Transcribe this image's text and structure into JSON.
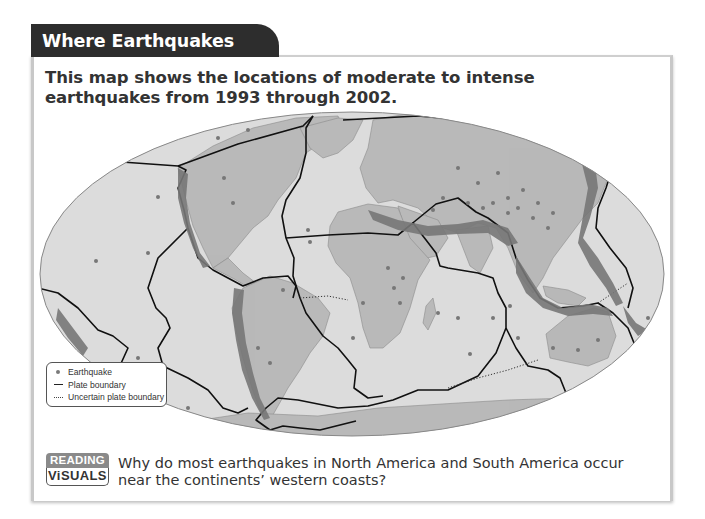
{
  "header": {
    "title": "Where Earthquakes Occur"
  },
  "intro": {
    "text": "This map shows the locations of moderate to intense earthquakes from 1993 through 2002."
  },
  "map": {
    "projection": "elliptical world map",
    "colors": {
      "ocean": "#dcdcdc",
      "land": "#b9b9b9",
      "earthquake": "#777777",
      "plate_boundary": "#111111",
      "outline": "#888888"
    }
  },
  "legend": {
    "items": [
      {
        "symbol": "dot-icon",
        "label": "Earthquake"
      },
      {
        "symbol": "solid-line-icon",
        "label": "Plate boundary"
      },
      {
        "symbol": "dotted-line-icon",
        "label": "Uncertain plate boundary"
      }
    ]
  },
  "reading_visuals": {
    "badge_top": "READING",
    "badge_bottom": "ViSUALS",
    "question": "Why do most earthquakes in North America and South America occur near the continents’ western coasts?"
  }
}
